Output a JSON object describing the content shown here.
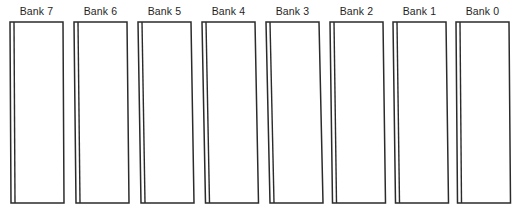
{
  "diagram": {
    "background_color": "#ffffff",
    "stroke_color": "#2b2b2b",
    "fill_color": "#ffffff",
    "label_color": "#1f1f1f",
    "label_font_size_px": 10.5,
    "canvas": {
      "width": 516,
      "height": 211
    },
    "geometry": {
      "bank_count": 8,
      "first_bank_left_x": 10,
      "bank_pitch_x": 64,
      "bank_width": 53,
      "bank_top_y": 22,
      "bank_bottom_y": 203,
      "bank_gap_x": 11,
      "spine_offset_x": 4,
      "skew_bottom_offset_x": 2.5,
      "label_baseline_y": 15
    },
    "banks": [
      {
        "label": "Bank 7",
        "index": 7,
        "left_x": 10,
        "skew": 1.0
      },
      {
        "label": "Bank 6",
        "index": 6,
        "left_x": 74,
        "skew": 2.0
      },
      {
        "label": "Bank 5",
        "index": 5,
        "left_x": 138,
        "skew": 3.0
      },
      {
        "label": "Bank 4",
        "index": 4,
        "left_x": 202,
        "skew": 3.5
      },
      {
        "label": "Bank 3",
        "index": 3,
        "left_x": 266,
        "skew": 4.0
      },
      {
        "label": "Bank 2",
        "index": 2,
        "left_x": 330,
        "skew": 2.5
      },
      {
        "label": "Bank 1",
        "index": 1,
        "left_x": 393,
        "skew": 2.5
      },
      {
        "label": "Bank 0",
        "index": 0,
        "left_x": 456,
        "skew": 1.5
      }
    ]
  }
}
